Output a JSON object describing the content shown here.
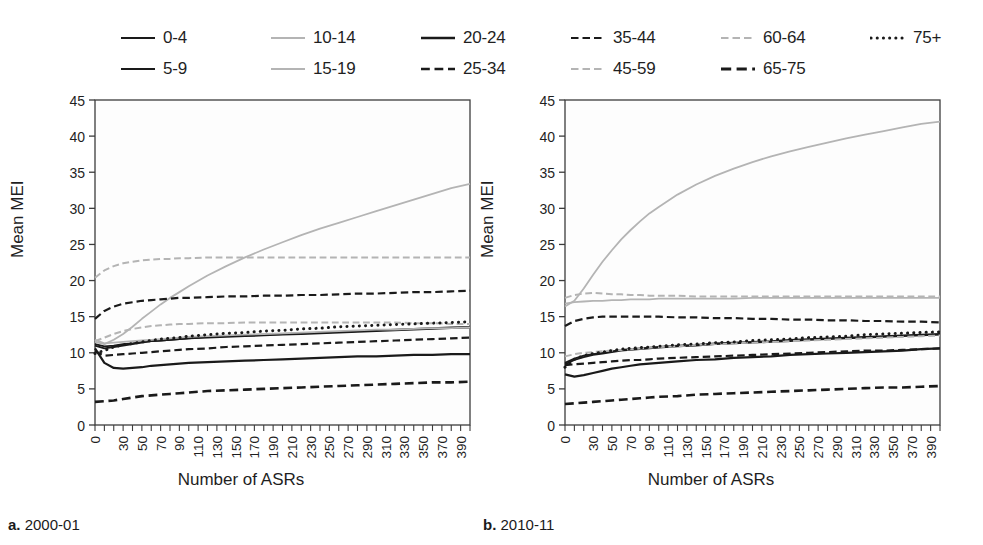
{
  "figure": {
    "panels": [
      {
        "id": "a",
        "caption_marker": "a.",
        "caption_text": " 2000-01"
      },
      {
        "id": "b",
        "caption_marker": "b.",
        "caption_text": " 2010-11"
      }
    ]
  },
  "legend": {
    "position": "top",
    "entries": [
      {
        "label": "0-4",
        "style": "solid",
        "color": "#1a1a1a",
        "width": 2.2
      },
      {
        "label": "5-9",
        "style": "solid",
        "color": "#1a1a1a",
        "width": 2.2
      },
      {
        "label": "10-14",
        "style": "solid",
        "color": "#b4b4b4",
        "width": 2.2
      },
      {
        "label": "15-19",
        "style": "solid",
        "color": "#b4b4b4",
        "width": 2.2
      },
      {
        "label": "20-24",
        "style": "solid",
        "color": "#1a1a1a",
        "width": 2.6
      },
      {
        "label": "25-34",
        "style": "dashed",
        "color": "#1a1a1a",
        "width": 2.6
      },
      {
        "label": "35-44",
        "style": "dashed",
        "color": "#1a1a1a",
        "width": 2.2
      },
      {
        "label": "45-59",
        "style": "dashed",
        "color": "#b4b4b4",
        "width": 2.2
      },
      {
        "label": "60-64",
        "style": "dashed",
        "color": "#b4b4b4",
        "width": 2.2
      },
      {
        "label": "65-75",
        "style": "dashed",
        "color": "#1a1a1a",
        "width": 3.0
      },
      {
        "label": "75+",
        "style": "dotted",
        "color": "#1a1a1a",
        "width": 3.0
      }
    ]
  },
  "chart_data": [
    {
      "type": "line",
      "panel": "a",
      "title": "a. 2000-01",
      "xlabel": "Number of ASRs",
      "ylabel": "Mean MEI",
      "xlim": [
        0,
        400
      ],
      "ylim": [
        0,
        45
      ],
      "yticks": [
        0,
        5,
        10,
        15,
        20,
        25,
        30,
        35,
        40,
        45
      ],
      "xticks": [
        0,
        30,
        50,
        70,
        90,
        110,
        130,
        150,
        170,
        190,
        210,
        230,
        250,
        270,
        290,
        310,
        330,
        350,
        370,
        390
      ],
      "grid": false,
      "x": [
        0,
        10,
        20,
        30,
        40,
        50,
        60,
        70,
        80,
        90,
        100,
        120,
        140,
        160,
        180,
        200,
        220,
        240,
        260,
        280,
        300,
        320,
        340,
        360,
        380,
        400
      ],
      "series": [
        {
          "name": "0-4",
          "style": "solid",
          "color": "#1a1a1a",
          "width": 1.8,
          "values": [
            11.0,
            10.6,
            10.8,
            11.0,
            11.2,
            11.4,
            11.6,
            11.7,
            11.8,
            11.9,
            12.0,
            12.1,
            12.2,
            12.3,
            12.4,
            12.5,
            12.6,
            12.7,
            12.8,
            12.9,
            13.0,
            13.1,
            13.2,
            13.3,
            13.4,
            13.5
          ]
        },
        {
          "name": "5-9",
          "style": "solid",
          "color": "#1a1a1a",
          "width": 1.8,
          "values": [
            11.2,
            10.9,
            11.0,
            11.2,
            11.3,
            11.5,
            11.6,
            11.7,
            11.8,
            11.9,
            12.0,
            12.2,
            12.3,
            12.4,
            12.5,
            12.6,
            12.7,
            12.8,
            12.9,
            13.0,
            13.1,
            13.2,
            13.3,
            13.4,
            13.5,
            13.6
          ]
        },
        {
          "name": "10-14",
          "style": "solid",
          "color": "#b4b4b4",
          "width": 1.8,
          "values": [
            11.5,
            11.2,
            11.8,
            12.6,
            13.6,
            14.7,
            15.7,
            16.7,
            17.6,
            18.4,
            19.2,
            20.7,
            22.0,
            23.2,
            24.3,
            25.3,
            26.3,
            27.2,
            28.0,
            28.8,
            29.6,
            30.4,
            31.2,
            32.0,
            32.8,
            33.4
          ]
        },
        {
          "name": "15-19",
          "style": "solid",
          "color": "#b4b4b4",
          "width": 1.8,
          "values": [
            11.8,
            11.3,
            11.4,
            11.5,
            11.6,
            11.7,
            11.8,
            11.9,
            12.0,
            12.1,
            12.2,
            12.3,
            12.4,
            12.5,
            12.6,
            12.7,
            12.8,
            12.9,
            13.0,
            13.1,
            13.2,
            13.2,
            13.3,
            13.4,
            13.4,
            13.5
          ]
        },
        {
          "name": "20-24",
          "style": "solid",
          "color": "#1a1a1a",
          "width": 2.2,
          "values": [
            10.6,
            8.6,
            7.9,
            7.8,
            7.9,
            8.0,
            8.2,
            8.3,
            8.4,
            8.5,
            8.6,
            8.7,
            8.8,
            8.9,
            9.0,
            9.1,
            9.2,
            9.3,
            9.4,
            9.5,
            9.5,
            9.6,
            9.7,
            9.7,
            9.8,
            9.8
          ]
        },
        {
          "name": "25-34",
          "style": "dashed",
          "color": "#1a1a1a",
          "width": 2.2,
          "values": [
            10.2,
            9.6,
            9.7,
            9.8,
            9.9,
            10.0,
            10.1,
            10.2,
            10.3,
            10.4,
            10.5,
            10.6,
            10.8,
            10.9,
            11.0,
            11.1,
            11.2,
            11.3,
            11.4,
            11.5,
            11.6,
            11.7,
            11.8,
            11.9,
            12.0,
            12.1
          ]
        },
        {
          "name": "35-44",
          "style": "dashed",
          "color": "#1a1a1a",
          "width": 2.2,
          "values": [
            14.7,
            15.8,
            16.4,
            16.8,
            17.0,
            17.2,
            17.3,
            17.4,
            17.5,
            17.6,
            17.6,
            17.7,
            17.8,
            17.8,
            17.9,
            17.9,
            18.0,
            18.0,
            18.1,
            18.2,
            18.2,
            18.3,
            18.4,
            18.4,
            18.5,
            18.6
          ]
        },
        {
          "name": "45-59",
          "style": "dashed",
          "color": "#b4b4b4",
          "width": 2.0,
          "values": [
            11.6,
            12.1,
            12.6,
            13.0,
            13.3,
            13.5,
            13.7,
            13.8,
            13.9,
            14.0,
            14.0,
            14.1,
            14.1,
            14.2,
            14.2,
            14.2,
            14.2,
            14.2,
            14.2,
            14.2,
            14.2,
            14.2,
            14.1,
            14.1,
            14.0,
            14.0
          ]
        },
        {
          "name": "60-64",
          "style": "dashed",
          "color": "#b4b4b4",
          "width": 2.0,
          "values": [
            20.4,
            21.4,
            22.0,
            22.4,
            22.6,
            22.8,
            22.9,
            23.0,
            23.0,
            23.1,
            23.1,
            23.2,
            23.2,
            23.2,
            23.2,
            23.2,
            23.2,
            23.2,
            23.2,
            23.2,
            23.2,
            23.2,
            23.2,
            23.2,
            23.2,
            23.2
          ]
        },
        {
          "name": "65-75",
          "style": "dashed",
          "color": "#1a1a1a",
          "width": 2.6,
          "values": [
            3.2,
            3.3,
            3.4,
            3.6,
            3.8,
            4.0,
            4.1,
            4.2,
            4.3,
            4.4,
            4.5,
            4.7,
            4.8,
            4.9,
            5.0,
            5.1,
            5.2,
            5.3,
            5.4,
            5.5,
            5.6,
            5.7,
            5.8,
            5.9,
            5.9,
            6.0
          ]
        },
        {
          "name": "75+",
          "style": "dotted",
          "color": "#1a1a1a",
          "width": 3.0,
          "values": [
            9.9,
            10.3,
            10.8,
            11.1,
            11.3,
            11.5,
            11.7,
            11.9,
            12.0,
            12.1,
            12.3,
            12.5,
            12.7,
            12.8,
            13.0,
            13.1,
            13.3,
            13.4,
            13.6,
            13.7,
            13.8,
            13.9,
            14.0,
            14.1,
            14.2,
            14.3
          ]
        }
      ]
    },
    {
      "type": "line",
      "panel": "b",
      "title": "b. 2010-11",
      "xlabel": "Number of ASRs",
      "ylabel": "Mean MEI",
      "xlim": [
        0,
        400
      ],
      "ylim": [
        0,
        45
      ],
      "yticks": [
        0,
        5,
        10,
        15,
        20,
        25,
        30,
        35,
        40,
        45
      ],
      "xticks": [
        0,
        30,
        50,
        70,
        90,
        110,
        130,
        150,
        170,
        190,
        210,
        230,
        250,
        270,
        290,
        310,
        330,
        350,
        370,
        390
      ],
      "grid": false,
      "x": [
        0,
        10,
        20,
        30,
        40,
        50,
        60,
        70,
        80,
        90,
        100,
        120,
        140,
        160,
        180,
        200,
        220,
        240,
        260,
        280,
        300,
        320,
        340,
        360,
        380,
        400
      ],
      "series": [
        {
          "name": "0-4",
          "style": "solid",
          "color": "#1a1a1a",
          "width": 1.8,
          "values": [
            8.4,
            9.0,
            9.4,
            9.7,
            9.9,
            10.1,
            10.3,
            10.4,
            10.5,
            10.6,
            10.7,
            10.9,
            11.0,
            11.2,
            11.3,
            11.4,
            11.5,
            11.6,
            11.8,
            11.9,
            12.0,
            12.1,
            12.2,
            12.3,
            12.4,
            12.5
          ]
        },
        {
          "name": "5-9",
          "style": "solid",
          "color": "#1a1a1a",
          "width": 1.8,
          "values": [
            8.6,
            9.2,
            9.6,
            9.8,
            10.0,
            10.2,
            10.4,
            10.5,
            10.6,
            10.7,
            10.8,
            11.0,
            11.1,
            11.3,
            11.4,
            11.5,
            11.6,
            11.8,
            11.9,
            12.0,
            12.1,
            12.2,
            12.3,
            12.4,
            12.5,
            12.6
          ]
        },
        {
          "name": "10-14",
          "style": "solid",
          "color": "#b4b4b4",
          "width": 1.8,
          "values": [
            16.4,
            17.2,
            18.9,
            20.8,
            22.6,
            24.2,
            25.7,
            27.0,
            28.2,
            29.3,
            30.2,
            31.9,
            33.3,
            34.5,
            35.5,
            36.4,
            37.2,
            37.9,
            38.5,
            39.1,
            39.7,
            40.2,
            40.7,
            41.2,
            41.7,
            42.0
          ]
        },
        {
          "name": "15-19",
          "style": "solid",
          "color": "#b4b4b4",
          "width": 1.8,
          "values": [
            16.8,
            17.0,
            17.1,
            17.2,
            17.2,
            17.3,
            17.3,
            17.4,
            17.4,
            17.4,
            17.5,
            17.5,
            17.5,
            17.5,
            17.5,
            17.6,
            17.6,
            17.6,
            17.6,
            17.6,
            17.6,
            17.6,
            17.6,
            17.6,
            17.6,
            17.6
          ]
        },
        {
          "name": "20-24",
          "style": "solid",
          "color": "#1a1a1a",
          "width": 2.2,
          "values": [
            7.0,
            6.7,
            6.9,
            7.2,
            7.5,
            7.8,
            8.0,
            8.2,
            8.4,
            8.5,
            8.6,
            8.8,
            9.0,
            9.1,
            9.3,
            9.4,
            9.5,
            9.7,
            9.8,
            9.9,
            10.0,
            10.1,
            10.2,
            10.3,
            10.5,
            10.6
          ]
        },
        {
          "name": "25-34",
          "style": "dashed",
          "color": "#1a1a1a",
          "width": 2.2,
          "values": [
            8.3,
            8.4,
            8.5,
            8.6,
            8.7,
            8.8,
            8.9,
            9.0,
            9.0,
            9.1,
            9.2,
            9.3,
            9.4,
            9.5,
            9.6,
            9.7,
            9.8,
            9.9,
            10.0,
            10.1,
            10.2,
            10.3,
            10.3,
            10.4,
            10.5,
            10.6
          ]
        },
        {
          "name": "35-44",
          "style": "dashed",
          "color": "#1a1a1a",
          "width": 2.2,
          "values": [
            13.7,
            14.4,
            14.7,
            14.9,
            15.0,
            15.0,
            15.0,
            15.0,
            15.0,
            15.0,
            15.0,
            14.9,
            14.9,
            14.8,
            14.8,
            14.7,
            14.7,
            14.6,
            14.6,
            14.5,
            14.5,
            14.4,
            14.4,
            14.3,
            14.3,
            14.2
          ]
        },
        {
          "name": "45-59",
          "style": "dashed",
          "color": "#b4b4b4",
          "width": 2.0,
          "values": [
            9.5,
            9.8,
            10.0,
            10.1,
            10.2,
            10.3,
            10.4,
            10.5,
            10.6,
            10.7,
            10.8,
            10.9,
            11.1,
            11.2,
            11.3,
            11.4,
            11.5,
            11.6,
            11.7,
            11.8,
            11.9,
            12.0,
            12.1,
            12.2,
            12.3,
            12.4
          ]
        },
        {
          "name": "60-64",
          "style": "dashed",
          "color": "#b4b4b4",
          "width": 2.0,
          "values": [
            17.6,
            18.0,
            18.2,
            18.3,
            18.2,
            18.1,
            18.1,
            18.0,
            18.0,
            17.9,
            17.9,
            17.9,
            17.8,
            17.8,
            17.8,
            17.8,
            17.8,
            17.8,
            17.8,
            17.8,
            17.8,
            17.8,
            17.8,
            17.8,
            17.8,
            17.8
          ]
        },
        {
          "name": "65-75",
          "style": "dashed",
          "color": "#1a1a1a",
          "width": 2.6,
          "values": [
            2.9,
            3.0,
            3.1,
            3.2,
            3.3,
            3.4,
            3.5,
            3.6,
            3.7,
            3.8,
            3.9,
            4.0,
            4.2,
            4.3,
            4.4,
            4.5,
            4.6,
            4.7,
            4.8,
            4.9,
            5.0,
            5.1,
            5.2,
            5.2,
            5.3,
            5.4
          ]
        },
        {
          "name": "75+",
          "style": "dotted",
          "color": "#1a1a1a",
          "width": 3.0,
          "values": [
            8.0,
            9.1,
            9.6,
            9.9,
            10.1,
            10.3,
            10.5,
            10.6,
            10.7,
            10.8,
            10.9,
            11.1,
            11.2,
            11.4,
            11.5,
            11.7,
            11.8,
            11.9,
            12.1,
            12.2,
            12.3,
            12.5,
            12.6,
            12.7,
            12.8,
            12.9
          ]
        }
      ]
    }
  ]
}
